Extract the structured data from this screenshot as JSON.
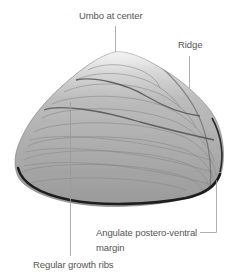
{
  "figure": {
    "colors": {
      "background": "#ffffff",
      "leader_line": "#9a9a9a",
      "label_text": "#555555",
      "shell_light": "#e2e2e2",
      "shell_mid": "#a8a8a8",
      "shell_dark": "#1e1e1e"
    }
  },
  "labels": {
    "umbo": "Umbo at center",
    "ridge": "Ridge",
    "margin_line1": "Angulate postero-ventral",
    "margin_line2": "margin",
    "ribs": "Regular growth ribs"
  }
}
